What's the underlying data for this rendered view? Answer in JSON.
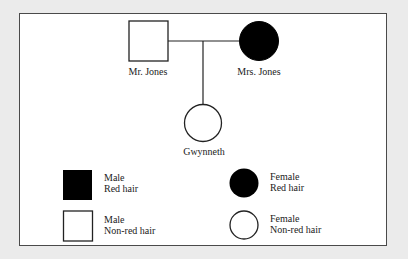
{
  "pedigree": {
    "individuals": [
      {
        "name": "Mr. Jones",
        "sex": "male",
        "trait": "non-red hair",
        "shape": "square",
        "filled": false
      },
      {
        "name": "Mrs. Jones",
        "sex": "female",
        "trait": "red hair",
        "shape": "circle",
        "filled": true
      },
      {
        "name": "Gwynneth",
        "sex": "female",
        "trait": "non-red hair",
        "shape": "circle",
        "filled": false
      }
    ],
    "labels": {
      "father": "Mr. Jones",
      "mother": "Mrs. Jones",
      "child": "Gwynneth"
    }
  },
  "legend": {
    "male_red": {
      "line1": "Male",
      "line2": "Red hair"
    },
    "male_nonred": {
      "line1": "Male",
      "line2": "Non-red hair"
    },
    "female_red": {
      "line1": "Female",
      "line2": "Red hair"
    },
    "female_nonred": {
      "line1": "Female",
      "line2": "Non-red hair"
    }
  },
  "colors": {
    "affected": "#000000",
    "unaffected": "#ffffff",
    "stroke": "#222222",
    "background": "#ebebeb"
  }
}
